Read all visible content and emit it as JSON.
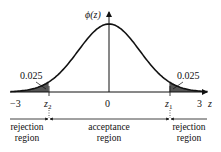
{
  "diagram": {
    "y_axis_label": "ϕ(z)",
    "x_axis_label": "z",
    "ticks": [
      {
        "label": "−3",
        "value": -3
      },
      {
        "label": "0",
        "value": 0
      },
      {
        "label": "3",
        "value": 3
      }
    ],
    "critical_points": {
      "left": {
        "label": "z",
        "subscript": "2",
        "value": -1.96
      },
      "right": {
        "label": "z",
        "subscript": "1",
        "value": 1.96
      }
    },
    "tail_areas": {
      "left": "0.025",
      "right": "0.025"
    },
    "regions": {
      "left": {
        "line1": "rejection",
        "line2": "region"
      },
      "middle": {
        "line1": "acceptance",
        "line2": "region"
      },
      "right": {
        "line1": "rejection",
        "line2": "region"
      }
    },
    "colors": {
      "curve": "#111111",
      "tail_fill": "#555555",
      "axis": "#111111"
    }
  }
}
